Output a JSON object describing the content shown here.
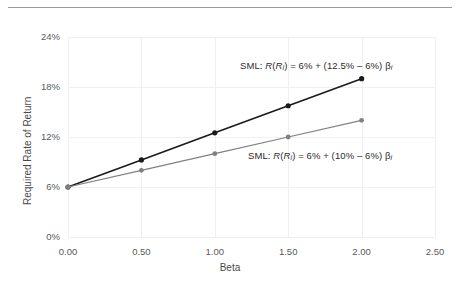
{
  "figure": {
    "has_top_rule": true,
    "background": "#ffffff"
  },
  "chart_data": {
    "type": "line",
    "title": "",
    "xlabel": "Beta",
    "ylabel": "Required Rate of Return",
    "xlim": [
      0.0,
      2.5
    ],
    "ylim": [
      0.0,
      24.0
    ],
    "xticks": [
      "0.00",
      "0.50",
      "1.00",
      "1.50",
      "2.00",
      "2.50"
    ],
    "xtick_values": [
      0.0,
      0.5,
      1.0,
      1.5,
      2.0,
      2.5
    ],
    "yticks": [
      "0%",
      "6%",
      "12%",
      "18%",
      "24%"
    ],
    "ytick_values": [
      0,
      6,
      12,
      18,
      24
    ],
    "grid": true,
    "legend_position": "none",
    "x": [
      0.0,
      0.5,
      1.0,
      1.5,
      2.0
    ],
    "series": [
      {
        "name": "SML 12.5% market return",
        "color": "#1a1a1a",
        "values": [
          6.0,
          9.25,
          12.5,
          15.75,
          19.0
        ],
        "marker": "circle"
      },
      {
        "name": "SML 10% market return",
        "color": "#808080",
        "values": [
          6.0,
          8.0,
          10.0,
          12.0,
          14.0
        ],
        "marker": "circle"
      }
    ],
    "annotations": [
      {
        "id": "annot-high",
        "prefix": "SML: ",
        "fn": "R",
        "arg_open": "(",
        "arg": "R",
        "arg_sub": "i",
        "arg_close": ")",
        "body": " = 6% + (12.5% – 6%) ",
        "beta": "β",
        "beta_sub": "i"
      },
      {
        "id": "annot-low",
        "prefix": "SML: ",
        "fn": "R",
        "arg_open": "(",
        "arg": "R",
        "arg_sub": "i",
        "arg_close": ")",
        "body": " = 6% + (10% – 6%) ",
        "beta": "β",
        "beta_sub": "i"
      }
    ],
    "colors": {
      "series_dark": "#1a1a1a",
      "series_light": "#808080",
      "gridline": "#f0f0f0",
      "axis": "#d8d8d8",
      "tick_text": "#595959",
      "title_text": "#4a4a4a",
      "top_rule": "#9a9a9a"
    }
  }
}
